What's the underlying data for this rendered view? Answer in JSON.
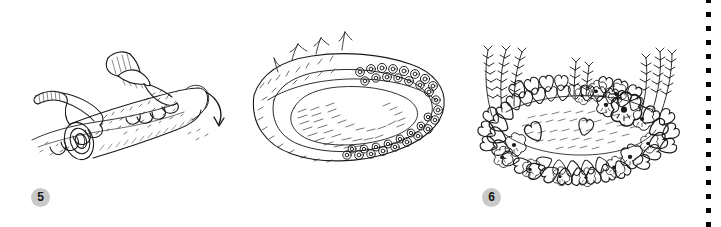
{
  "document": {
    "kind": "instructional-illustration",
    "background_color": "#ffffff",
    "ink_color": "#1a1a1a",
    "width": 721,
    "height": 227
  },
  "badge_style": {
    "fill": "#c9c9c9",
    "text_color": "#141414",
    "diameter": 19
  },
  "divider": {
    "name": "dotted-vertical-rule",
    "color": "#000000",
    "dot_size": 5,
    "dot_gap": 9,
    "x": 706
  },
  "panels": [
    {
      "step": "5",
      "name": "panel-unrolling-sod",
      "caption": "",
      "description": "Two gloved hands unrolling a strip of sod/turf across prepared soil, with a curved arrow indicating the rolling direction",
      "arrow": "curved-down-right"
    },
    {
      "step": "6",
      "name": "panel-planting-bed-edge",
      "caption": "",
      "description": "Oval raised garden bed seen in perspective with small round seedlings planted along the rim and hatched soil in the hollow",
      "arrow": ""
    },
    {
      "step": "7",
      "name": "panel-mature-flower-bed",
      "caption": "",
      "description": "The same bed fully grown in with pansies, heart-shaped leaves and tall spiky flowers filling the border",
      "arrow": ""
    }
  ]
}
